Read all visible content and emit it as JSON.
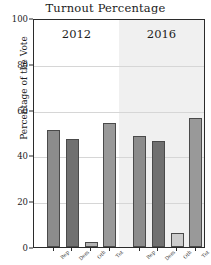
{
  "chart_data": {
    "type": "bar",
    "title": "Turnout Percentage",
    "xlabel": "",
    "ylabel": "Percentage of the Vote",
    "ylim": [
      0,
      100
    ],
    "yticks": [
      0,
      20,
      40,
      60,
      80,
      100
    ],
    "ytick_labels": [
      "0",
      "20",
      "40",
      "60",
      "80",
      "100"
    ],
    "grid": true,
    "legend": null,
    "panels": [
      {
        "label": "2012",
        "background": "#ffffff",
        "categories": [
          "Rep",
          "Dem",
          "Oth",
          "Tot"
        ],
        "values": [
          51.0,
          47.2,
          2.0,
          54.2
        ],
        "colors": [
          "#8c8c8c",
          "#707070",
          "#b3b3b3",
          "#999999"
        ]
      },
      {
        "label": "2016",
        "background": "#f0f0f0",
        "categories": [
          "Rep",
          "Dem",
          "Oth",
          "Tot"
        ],
        "values": [
          48.4,
          46.2,
          6.0,
          56.4
        ],
        "colors": [
          "#8c8c8c",
          "#707070",
          "#cccccc",
          "#999999"
        ]
      }
    ]
  },
  "colors": {
    "axis": "#2b2b2b",
    "grid": "#d6d6d6",
    "text": "#1c1c1c",
    "bar_light": "#8c8c8c",
    "bar_dark": "#707070",
    "panel_2016_bg": "#f0f0f0"
  }
}
